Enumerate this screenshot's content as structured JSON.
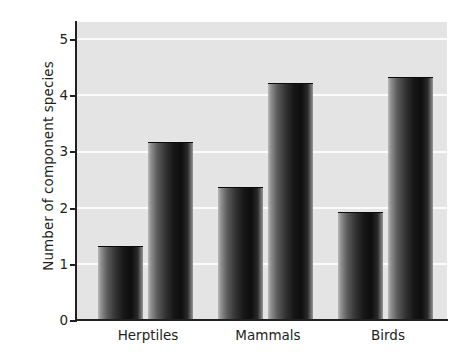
{
  "chart_data": {
    "type": "bar",
    "title": "",
    "xlabel": "",
    "ylabel": "Number of component species",
    "categories": [
      "Herptiles",
      "Mammals",
      "Birds"
    ],
    "series": [
      {
        "name": "series-1",
        "values": [
          1.3,
          2.35,
          1.9
        ]
      },
      {
        "name": "series-2",
        "values": [
          3.15,
          4.2,
          4.3
        ]
      }
    ],
    "values_in_plot_order": [
      1.3,
      3.15,
      2.35,
      4.2,
      1.9,
      4.3
    ],
    "ylim": [
      0,
      5.3
    ],
    "yticks": [
      0,
      1,
      2,
      3,
      4,
      5
    ],
    "ytick_labels": [
      "0",
      "1",
      "2",
      "3",
      "4",
      "5"
    ],
    "grid": true,
    "grid_axis": "y",
    "legend": "none",
    "colors": {
      "plot_background": "#e4e4e4",
      "gridline": "#fbfbfb",
      "axis": "#231f20",
      "bar_dark": "#0d0d0d",
      "bar_light": "#b9b9b9",
      "page_background": "#ffffff",
      "text": "#231f20"
    }
  },
  "axis": {
    "y_title": "Number of component species",
    "y_tick_5": "5",
    "y_tick_4": "4",
    "y_tick_3": "3",
    "y_tick_2": "2",
    "y_tick_1": "1",
    "y_tick_0": "0"
  },
  "x_labels": {
    "cat_0": "Herptiles",
    "cat_1": "Mammals",
    "cat_2": "Birds"
  }
}
